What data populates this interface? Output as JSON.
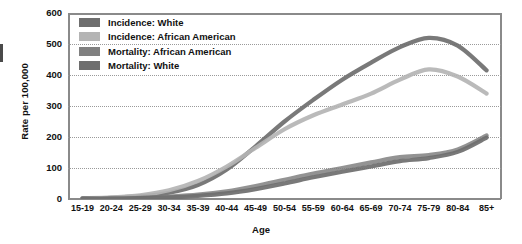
{
  "chart_data": {
    "type": "line",
    "title": "",
    "xlabel": "Age",
    "ylabel": "Rate per 100,000",
    "categories": [
      "15-19",
      "20-24",
      "25-29",
      "30-34",
      "35-39",
      "40-44",
      "45-49",
      "50-54",
      "55-59",
      "60-64",
      "65-69",
      "70-74",
      "75-79",
      "80-84",
      "85+"
    ],
    "ylim": [
      0,
      600
    ],
    "yticks": [
      0,
      100,
      200,
      300,
      400,
      500,
      600
    ],
    "ytick_labels": [
      "0",
      "100",
      "200",
      "300",
      "400",
      "500",
      "600"
    ],
    "grid": true,
    "legend_position": "top-left",
    "series": [
      {
        "name": "Incidence: White",
        "color": "#6e6e6e",
        "values": [
          2,
          4,
          9,
          20,
          45,
          95,
          170,
          250,
          320,
          385,
          440,
          490,
          520,
          495,
          415
        ]
      },
      {
        "name": "Incidence: African American",
        "color": "#b4b4b4",
        "values": [
          2,
          5,
          12,
          28,
          58,
          105,
          165,
          225,
          270,
          305,
          340,
          385,
          418,
          395,
          340
        ]
      },
      {
        "name": "Mortality: African American",
        "color": "#808080",
        "values": [
          1,
          2,
          4,
          8,
          14,
          25,
          42,
          62,
          82,
          100,
          118,
          135,
          142,
          160,
          205
        ]
      },
      {
        "name": "Mortality: White",
        "color": "#6e6e6e",
        "values": [
          1,
          1,
          3,
          5,
          10,
          18,
          32,
          50,
          70,
          88,
          105,
          122,
          132,
          152,
          198
        ]
      }
    ]
  },
  "axes": {
    "y_title": "Rate per 100,000",
    "x_title": "Age"
  },
  "legend": {
    "items": [
      {
        "label": "Incidence: White",
        "color": "#6e6e6e"
      },
      {
        "label": "Incidence: African American",
        "color": "#b4b4b4"
      },
      {
        "label": "Mortality: African American",
        "color": "#808080"
      },
      {
        "label": "Mortality: White",
        "color": "#6e6e6e"
      }
    ]
  }
}
